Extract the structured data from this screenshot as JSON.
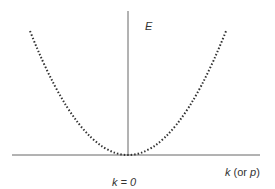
{
  "diagram": {
    "y_axis_label": "E",
    "x_axis_label_var": "k",
    "x_axis_label_paren_open": " (or ",
    "x_axis_label_alt": "p",
    "x_axis_label_paren_close": ")",
    "origin_label": "k = 0",
    "colors": {
      "axis": "#555555",
      "curve": "#333333",
      "text": "#333333"
    }
  }
}
